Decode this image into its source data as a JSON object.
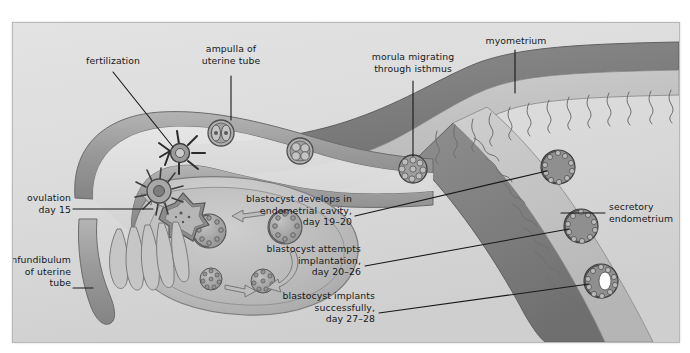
{
  "figure": {
    "background_color": "#dcdcdc",
    "ink_color": "#16181a",
    "tissue_mid": "#a9a9a9",
    "tissue_dark": "#7b7b7b",
    "tissue_light": "#c9c9c9",
    "highlight_white": "#ffffff"
  },
  "labels": {
    "fertilization": "fertilization",
    "ampulla": "ampulla of\nuterine tube",
    "morula": "morula migrating\nthrough isthmus",
    "myometrium": "myometrium",
    "ovulation": "ovulation\nday 15",
    "infundibulum": "infundibulum\nof uterine\ntube",
    "blastocyst_develops": "blastocyst develops in\nendometrial cavity,\nday 19–20",
    "blastocyst_attempts": "blastocyst attempts\nimplantation,\nday 20–26",
    "blastocyst_implants": "blastocyst implants\nsuccessfully,\nday 27–28",
    "secretory_endometrium": "secretory\nendometrium"
  },
  "structures": {
    "oocyte_fertilized": "fertilized oocyte with corona radiata",
    "two_cell": "two-cell stage embryo",
    "four_cell": "four-cell stage embryo",
    "morula_cell_cluster": "morula",
    "corpus_luteum": "corpus luteum",
    "ovarian_follicles": "developing ovarian follicles",
    "fimbriae": "fimbriae of infundibulum",
    "endometrial_glands": "coiled endometrial glands",
    "blastocysts": [
      "blastocyst in endometrial cavity",
      "blastocyst attempting implantation",
      "blastocyst implanted"
    ]
  },
  "stages": {
    "ovulation_day": "day 15",
    "develops_days": "day 19–20",
    "attempts_days": "day 20–26",
    "implants_days": "day 27–28"
  }
}
